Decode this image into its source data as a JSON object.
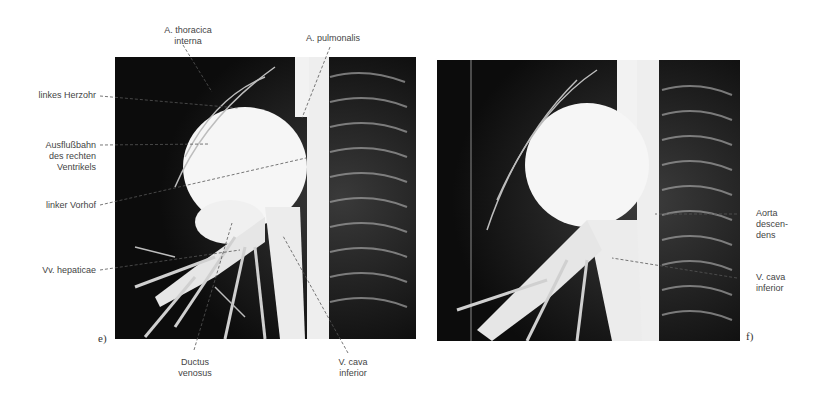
{
  "figure": {
    "panels": [
      {
        "id": "e",
        "label": "e)",
        "annotations": {
          "a_thoracica": "A. thoracica interna",
          "a_thoracica_l1": "A. thoracica",
          "a_thoracica_l2": "interna",
          "a_pulmonalis": "A. pulmonalis",
          "herzohr": "linkes Herzohr",
          "ausfluss_l1": "Ausflußbahn",
          "ausfluss_l2": "des rechten",
          "ausfluss_l3": "Ventrikels",
          "vorhof": "linker Vorhof",
          "hepaticae": "Vv. hepaticae",
          "ductus_l1": "Ductus",
          "ductus_l2": "venosus",
          "cava_l1": "V. cava",
          "cava_l2": "inferior"
        }
      },
      {
        "id": "f",
        "label": "f)",
        "annotations": {
          "aorta_l1": "Aorta",
          "aorta_l2": "descen-",
          "aorta_l3": "dens",
          "cava_l1": "V. cava",
          "cava_l2": "inferior"
        }
      }
    ],
    "colors": {
      "background": "#ffffff",
      "radiograph_bg": "#0c0c0c",
      "contrast": "#f4f4f4",
      "label_text": "#444444"
    }
  }
}
